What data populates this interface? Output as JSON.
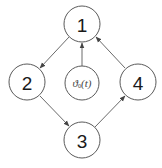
{
  "diagram": {
    "type": "directed-graph",
    "nodes": [
      {
        "id": "1",
        "label": "1",
        "cx": 82,
        "cy": 24
      },
      {
        "id": "2",
        "label": "2",
        "cx": 27,
        "cy": 82
      },
      {
        "id": "3",
        "label": "3",
        "cx": 82,
        "cy": 140
      },
      {
        "id": "4",
        "label": "4",
        "cx": 138,
        "cy": 82
      }
    ],
    "source_node": {
      "id": "theta0",
      "symbol": "ϑ",
      "subscript": "0",
      "argument": "(t)",
      "cx": 82,
      "cy": 83
    },
    "edges": [
      {
        "from": "1",
        "to": "2"
      },
      {
        "from": "2",
        "to": "3"
      },
      {
        "from": "3",
        "to": "4"
      },
      {
        "from": "4",
        "to": "1"
      },
      {
        "from": "theta0",
        "to": "1"
      }
    ],
    "colors": {
      "stroke": "#5a5a5a",
      "text": "#1a1a1a",
      "formula": "#444444"
    }
  }
}
